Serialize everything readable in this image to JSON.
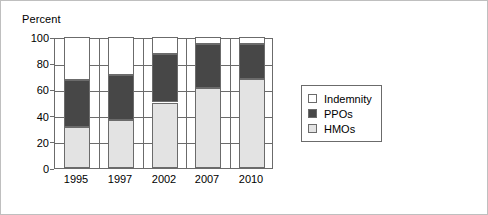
{
  "chart_data": {
    "type": "bar",
    "subtype": "stacked-bar",
    "title": "",
    "xlabel": "",
    "ylabel": "Percent",
    "categories": [
      "1995",
      "1997",
      "2002",
      "2007",
      "2010"
    ],
    "ylim": [
      0,
      100
    ],
    "yticks": [
      0,
      20,
      40,
      60,
      80,
      100
    ],
    "grid": true,
    "grid_axis": "both",
    "legend_position": "right",
    "stack_order_bottom_to_top": [
      "HMOs",
      "PPOs",
      "Indemnity"
    ],
    "series": [
      {
        "name": "HMOs",
        "color": "#e3e3e3",
        "values": [
          31,
          37,
          50,
          61,
          68
        ]
      },
      {
        "name": "PPOs",
        "color": "#474747",
        "values": [
          36,
          34,
          37,
          34,
          27
        ]
      },
      {
        "name": "Indemnity",
        "color": "#ffffff",
        "values": [
          33,
          29,
          13,
          5,
          5
        ]
      }
    ],
    "cumulative_tops": {
      "HMOs": [
        31,
        37,
        50,
        61,
        68
      ],
      "PPOs": [
        67,
        71,
        87,
        95,
        95
      ],
      "Indemnity": [
        100,
        100,
        100,
        100,
        100
      ]
    }
  },
  "legend": {
    "entries": [
      {
        "label": "Indemnity",
        "color": "#ffffff"
      },
      {
        "label": "PPOs",
        "color": "#474747"
      },
      {
        "label": "HMOs",
        "color": "#e3e3e3"
      }
    ]
  },
  "axis": {
    "y_title": "Percent",
    "y_ticks": [
      "100",
      "80",
      "60",
      "40",
      "20",
      "0"
    ],
    "x_ticks": [
      "1995",
      "1997",
      "2002",
      "2007",
      "2010"
    ]
  },
  "colors": {
    "hmo": "#e3e3e3",
    "ppo": "#474747",
    "indemnity": "#ffffff",
    "axis_line": "#6b6b6b",
    "frame": "#bfbfbf",
    "text": "#000000"
  }
}
